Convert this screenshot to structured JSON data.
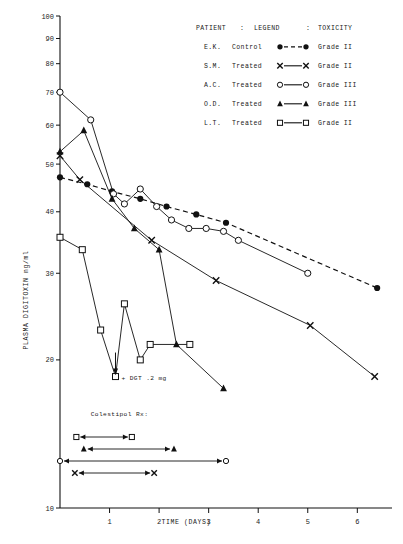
{
  "chart_data": {
    "type": "line",
    "title": "",
    "xlabel": "TIME   (DAYS)",
    "ylabel": "PLASMA DIGITOXIN ng/ml",
    "xlim": [
      0,
      6.7
    ],
    "ylim": [
      10,
      100
    ],
    "yscale": "log",
    "grid": false,
    "xticks": [
      1,
      2,
      3,
      4,
      5,
      6
    ],
    "xtick_labels": [
      "1",
      "2",
      "3",
      "4",
      "5",
      "6"
    ],
    "yticks": [
      10,
      20,
      30,
      40,
      50,
      60,
      70,
      80,
      90,
      100
    ],
    "ytick_labels": [
      "10",
      "20",
      "30",
      "40",
      "50",
      "60",
      "70",
      "80",
      "90",
      "100"
    ],
    "legend_position": "top-right",
    "series": [
      {
        "name": "E.K.",
        "treatment": "Control",
        "toxicity": "Grade II",
        "marker": "filled-circle",
        "line": "dashed",
        "x": [
          0.0,
          0.55,
          1.05,
          1.62,
          2.15,
          2.75,
          3.35,
          6.4
        ],
        "y": [
          47.0,
          45.5,
          44.0,
          42.5,
          41.0,
          39.5,
          38.0,
          28.0
        ]
      },
      {
        "name": "S.M.",
        "treatment": "Treated",
        "toxicity": "Grade II",
        "marker": "cross-x",
        "line": "solid",
        "x": [
          0.0,
          0.4,
          1.85,
          3.15,
          5.05,
          6.35
        ],
        "y": [
          52.0,
          46.5,
          35.0,
          29.0,
          23.5,
          18.5
        ]
      },
      {
        "name": "A.C.",
        "treatment": "Treated",
        "toxicity": "Grade III",
        "marker": "open-circle",
        "line": "solid",
        "x": [
          0.0,
          0.62,
          1.08,
          1.3,
          1.62,
          1.95,
          2.25,
          2.6,
          2.95,
          3.3,
          3.6,
          5.0
        ],
        "y": [
          70.0,
          61.5,
          43.5,
          41.5,
          44.5,
          41.0,
          38.5,
          37.0,
          37.0,
          36.5,
          35.0,
          30.0
        ]
      },
      {
        "name": "O.D.",
        "treatment": "Treated",
        "toxicity": "Grade III",
        "marker": "filled-triangle",
        "line": "solid",
        "x": [
          0.0,
          0.48,
          1.05,
          1.5,
          2.0,
          2.35,
          3.3
        ],
        "y": [
          53.0,
          58.5,
          42.5,
          37.0,
          33.5,
          21.5,
          17.5
        ]
      },
      {
        "name": "L.T.",
        "treatment": "Treated",
        "toxicity": "Grade II",
        "marker": "open-square",
        "line": "solid",
        "x": [
          0.0,
          0.45,
          0.82,
          1.12,
          1.3,
          1.62,
          1.82,
          2.62
        ],
        "y": [
          35.5,
          33.5,
          23.0,
          18.5,
          26.0,
          20.0,
          21.5,
          21.5
        ]
      }
    ],
    "annotations": [
      {
        "text": "+ DGT .2 mg",
        "x": 1.12,
        "y": 18.5
      },
      {
        "text": "Colestipol Rx:",
        "x": 0.62,
        "y": 15.4
      }
    ],
    "treatment_bars": [
      {
        "marker": "open-square",
        "x_start": 0.33,
        "x_end": 1.45
      },
      {
        "marker": "filled-triangle",
        "x_start": 0.48,
        "x_end": 2.3
      },
      {
        "marker": "open-circle",
        "x_start": 0.0,
        "x_end": 3.35
      },
      {
        "marker": "cross-x",
        "x_start": 0.3,
        "x_end": 1.9
      }
    ]
  },
  "legend": {
    "header": {
      "patient": "PATIENT",
      "sep1": ":",
      "legend": "LEGEND",
      "sep2": ":",
      "toxicity": "TOXICITY"
    },
    "rows": [
      {
        "patient": "E.K.",
        "treatment": "Control",
        "toxicity": "Grade II"
      },
      {
        "patient": "S.M.",
        "treatment": "Treated",
        "toxicity": "Grade II"
      },
      {
        "patient": "A.C.",
        "treatment": "Treated",
        "toxicity": "Grade III"
      },
      {
        "patient": "O.D.",
        "treatment": "Treated",
        "toxicity": "Grade III"
      },
      {
        "patient": "L.T.",
        "treatment": "Treated",
        "toxicity": "Grade II"
      }
    ]
  },
  "colors": {
    "ink": "#111111",
    "background": "#ffffff"
  }
}
